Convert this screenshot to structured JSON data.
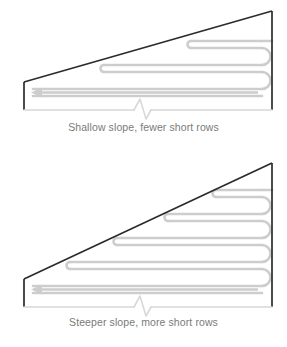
{
  "figures": [
    {
      "id": "shallow",
      "caption": "Shallow slope, fewer short rows",
      "row_count": 3,
      "bend_count": 2,
      "arrow_direction": "left",
      "has_break_symbol": true,
      "slope_description": "shallow"
    },
    {
      "id": "steep",
      "caption": "Steeper slope, more short rows",
      "row_count": 5,
      "bend_count": 4,
      "arrow_direction": "left",
      "has_break_symbol": true,
      "slope_description": "steeper"
    }
  ],
  "colors": {
    "outline": "#2b2b2b",
    "ribbon": "#cdcdcd",
    "baseline": "#d8d8d8",
    "caption_text": "#7a7a7a",
    "background": "#ffffff"
  }
}
